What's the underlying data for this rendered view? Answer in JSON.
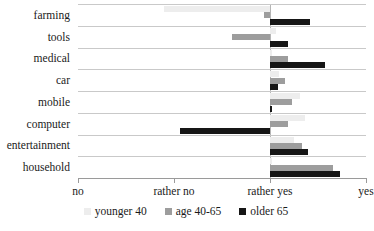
{
  "chart_data": {
    "type": "bar",
    "title": "",
    "xlabel": "",
    "ylabel": "",
    "orientation": "horizontal",
    "baseline_category": "rather yes",
    "grid": true,
    "legend_position": "bottom",
    "xtick_labels": [
      "no",
      "rather no",
      "rather yes",
      "yes"
    ],
    "xtick_values": [
      1,
      2,
      3,
      4
    ],
    "xlim": [
      1,
      4
    ],
    "categories": [
      "farming",
      "tools",
      "medical",
      "car",
      "mobile",
      "computer",
      "entertainment",
      "household"
    ],
    "series": [
      {
        "name": "younger 40",
        "color": "#ededed",
        "deviation_from_baseline": [
          -1.1,
          0.06,
          0.0,
          0.09,
          0.31,
          0.36,
          0.25,
          0.0
        ],
        "values": [
          1.9,
          3.06,
          3.0,
          3.09,
          3.31,
          3.36,
          3.25,
          3.0
        ]
      },
      {
        "name": "age 40-65",
        "color": "#9d9d9d",
        "deviation_from_baseline": [
          -0.06,
          -0.4,
          0.19,
          0.16,
          0.23,
          0.19,
          0.33,
          0.66
        ],
        "values": [
          2.94,
          2.6,
          3.19,
          3.16,
          3.23,
          3.19,
          3.33,
          3.66
        ]
      },
      {
        "name": "older 65",
        "color": "#161616",
        "deviation_from_baseline": [
          0.42,
          0.19,
          0.57,
          0.08,
          0.02,
          -0.94,
          0.4,
          0.73
        ],
        "values": [
          3.42,
          3.19,
          3.57,
          3.08,
          3.02,
          2.06,
          3.4,
          3.73
        ]
      }
    ]
  },
  "legend": {
    "items": [
      {
        "label": "younger 40",
        "swatch": "younger-swatch-icon"
      },
      {
        "label": "age 40-65",
        "swatch": "middle-swatch-icon"
      },
      {
        "label": "older 65",
        "swatch": "older-swatch-icon"
      }
    ]
  }
}
